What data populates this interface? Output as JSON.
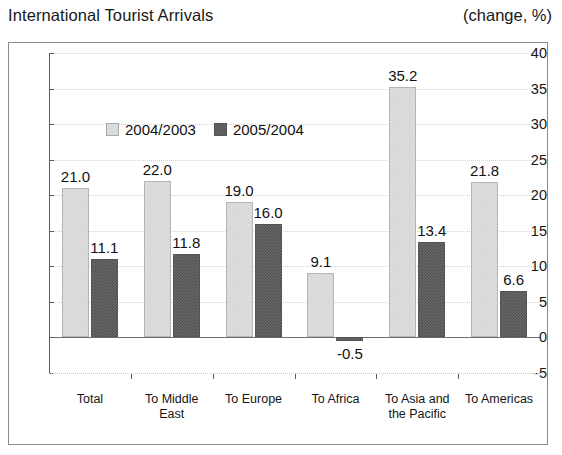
{
  "header": {
    "title": "International Tourist Arrivals",
    "unit": "(change, %)"
  },
  "chart_data": {
    "type": "bar",
    "title": "International Tourist Arrivals",
    "subtitle": "(change, %)",
    "xlabel": "",
    "ylabel": "",
    "ylim": [
      -5,
      40
    ],
    "ytick_values": [
      40,
      35,
      30,
      25,
      20,
      15,
      10,
      5,
      0,
      -5
    ],
    "ytick_labels": [
      "40",
      "35",
      "30",
      "25",
      "20",
      "15",
      "10",
      "5",
      "0",
      "-5"
    ],
    "grid": true,
    "legend_position": "top-left-inside",
    "categories": [
      "Total",
      "To Middle East",
      "To Europe",
      "To Africa",
      "To Asia and the Pacific",
      "To Americas"
    ],
    "category_lines": [
      [
        "Total"
      ],
      [
        "To Middle",
        "East"
      ],
      [
        "To Europe"
      ],
      [
        "To Africa"
      ],
      [
        "To Asia and",
        "the Pacific"
      ],
      [
        "To Americas"
      ]
    ],
    "series": [
      {
        "name": "2004/2003",
        "color": "#e2e2e2",
        "values": [
          21.0,
          22.0,
          19.0,
          9.1,
          35.2,
          21.8
        ],
        "labels": [
          "21.0",
          "22.0",
          "19.0",
          "9.1",
          "35.2",
          "21.8"
        ]
      },
      {
        "name": "2005/2004",
        "color": "#6b6b6b",
        "values": [
          11.1,
          11.8,
          16.0,
          -0.5,
          13.4,
          6.6
        ],
        "labels": [
          "11.1",
          "11.8",
          "16.0",
          "-0.5",
          "13.4",
          "6.6"
        ]
      }
    ]
  }
}
